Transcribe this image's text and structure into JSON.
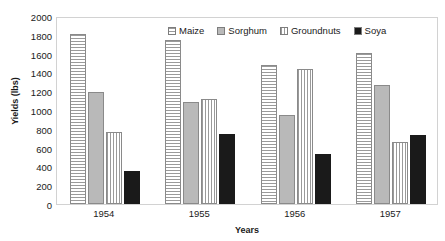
{
  "chart_data": {
    "type": "bar",
    "title": "",
    "xlabel": "Years",
    "ylabel": "Yields (lbs)",
    "categories": [
      "1954",
      "1955",
      "1956",
      "1957"
    ],
    "ylim": [
      0,
      2000
    ],
    "yticks": [
      "0",
      "200",
      "400",
      "600",
      "800",
      "1000",
      "1200",
      "1400",
      "1600",
      "1800",
      "2000"
    ],
    "ytick_values": [
      0,
      200,
      400,
      600,
      800,
      1000,
      1200,
      1400,
      1600,
      1800,
      2000
    ],
    "grid": false,
    "legend_position": "top-center-inside",
    "series": [
      {
        "name": "Maize",
        "pattern": "horizontal-lines",
        "color": "#ffffff",
        "values": [
          1810,
          1740,
          1475,
          1610
        ]
      },
      {
        "name": "Sorghum",
        "pattern": "solid-gray",
        "color": "#b9b9b9",
        "values": [
          1190,
          1080,
          950,
          1265
        ]
      },
      {
        "name": "Groundnuts",
        "pattern": "vertical-lines",
        "color": "#ffffff",
        "values": [
          765,
          1120,
          1440,
          655
        ]
      },
      {
        "name": "Soya",
        "pattern": "solid-black",
        "color": "#1a1a1a",
        "values": [
          355,
          750,
          530,
          730
        ]
      }
    ]
  }
}
